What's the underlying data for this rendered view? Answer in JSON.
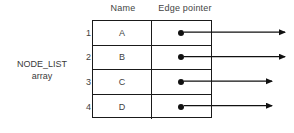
{
  "diagram": {
    "title_label": "NODE_LIST\narray",
    "array_label_line1": "NODE_LIST",
    "array_label_line2": "array",
    "headers": {
      "name": "Name",
      "edge_pointer": "Edge pointer"
    },
    "rows": [
      {
        "index": "1",
        "name": "A",
        "pointer": "●",
        "arrow_length": 285
      },
      {
        "index": "2",
        "name": "B",
        "pointer": "●",
        "arrow_length": 285
      },
      {
        "index": "3",
        "name": "C",
        "pointer": "●",
        "arrow_length": 272
      },
      {
        "index": "4",
        "name": "D",
        "pointer": "●",
        "arrow_length": 272
      }
    ],
    "colors": {
      "line": "#1a1a1a",
      "text": "#3f3f3f",
      "header_text": "#444444",
      "background": "#ffffff",
      "dot": "#111111"
    }
  }
}
